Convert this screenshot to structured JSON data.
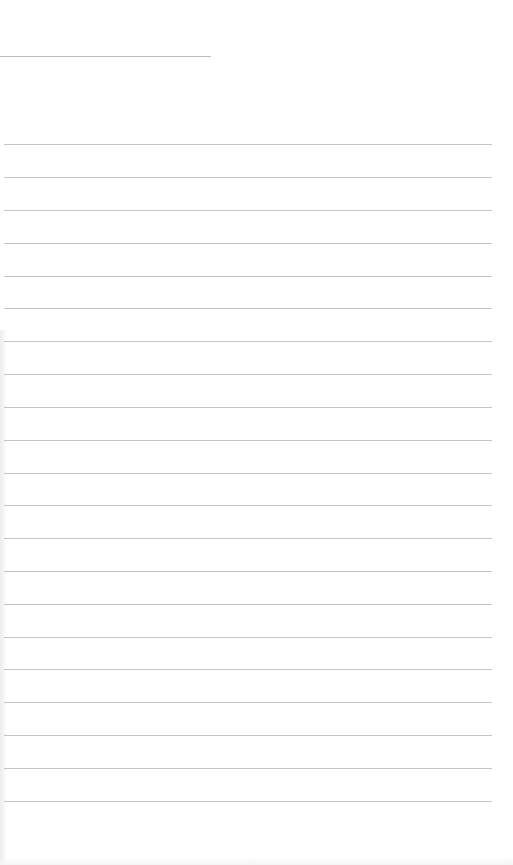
{
  "paper": {
    "type": "lined-notebook-page",
    "background_color": "#ffffff",
    "rule_color": "#c4c4c4",
    "header_line": {
      "y": 56,
      "x_start": 0,
      "x_end": 211
    },
    "rules": {
      "x_start": 4,
      "x_end": 492,
      "y_positions": [
        144,
        177,
        210,
        243,
        276,
        308,
        341,
        374,
        407,
        440,
        473,
        505,
        538,
        571,
        604,
        637,
        669,
        702,
        735,
        768,
        801
      ]
    }
  }
}
